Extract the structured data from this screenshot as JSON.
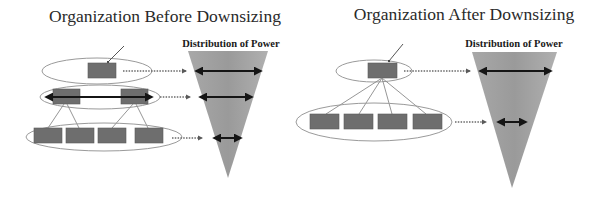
{
  "panels": [
    {
      "id": "before",
      "title": "Organization Before Downsizing",
      "distribution_label": "Distribution of Power",
      "levels": [
        {
          "name": "top",
          "box_count": 1,
          "power_width": "widest"
        },
        {
          "name": "middle",
          "box_count": 2,
          "power_width": "medium"
        },
        {
          "name": "bottom",
          "box_count": 4,
          "power_width": "narrow"
        }
      ]
    },
    {
      "id": "after",
      "title": "Organization After Downsizing",
      "distribution_label": "Distribution of Power",
      "levels": [
        {
          "name": "top",
          "box_count": 1,
          "power_width": "widest"
        },
        {
          "name": "bottom",
          "box_count": 4,
          "power_width": "narrow"
        }
      ]
    }
  ],
  "colors": {
    "box": "#6e6e6e",
    "triangle": "#9c9c9c",
    "arrow": "#151515",
    "ellipse": "#9a9a9a"
  }
}
